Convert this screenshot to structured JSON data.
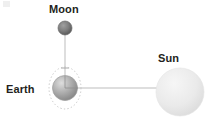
{
  "diagram": {
    "background_color": "#ffffff",
    "width": 206,
    "height": 130,
    "label_color": "#231f20",
    "line_color": "#b3b3b3"
  },
  "labels": {
    "moon": "Moon",
    "earth": "Earth",
    "sun": "Sun"
  },
  "bodies": [
    {
      "name": "moon",
      "label": "Moon",
      "cx": 65,
      "cy": 28,
      "r": 7,
      "fill_light": "#8e8e8e",
      "fill_dark": "#5d5d5d",
      "stroke": "#6f6f6f"
    },
    {
      "name": "earth",
      "label": "Earth",
      "cx": 65,
      "cy": 88,
      "r": 12.5,
      "fill_light": "#d6d6d6",
      "fill_dark": "#8a8a8a",
      "stroke": "#9a9a9a"
    },
    {
      "name": "sun",
      "label": "Sun",
      "cx": 180,
      "cy": 92,
      "r": 24,
      "fill_light": "#f2f2f2",
      "fill_dark": "#dedede",
      "stroke": "#e2e2e2"
    }
  ],
  "orbit": {
    "name": "moon-orbit-around-earth",
    "cx": 65,
    "cy": 88,
    "rx": 16,
    "ry": 21,
    "stroke": "#c4c4c4",
    "dash": "1.4 2.2"
  },
  "connectors": [
    {
      "name": "moon-earth-axis",
      "x1": 65,
      "y1": 30,
      "x2": 65,
      "y2": 92,
      "stroke": "#b5b5b5"
    },
    {
      "name": "earth-sun-axis",
      "x1": 64,
      "y1": 88,
      "x2": 182,
      "y2": 88,
      "stroke": "#b5b5b5"
    }
  ],
  "tick_marks": [
    {
      "name": "earth-top-tick",
      "x1": 61,
      "y1": 68,
      "x2": 69,
      "y2": 68
    }
  ]
}
